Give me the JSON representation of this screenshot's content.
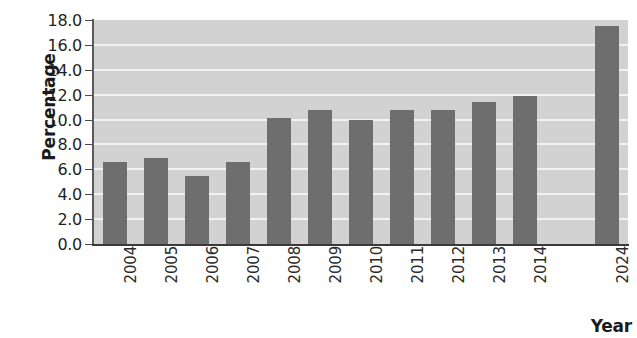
{
  "chart_data": {
    "type": "bar",
    "title": "",
    "xlabel": "Year",
    "ylabel": "Percentage",
    "categories": [
      "2004",
      "2005",
      "2006",
      "2007",
      "2008",
      "2009",
      "2010",
      "2011",
      "2012",
      "2013",
      "2014",
      "2024"
    ],
    "values": [
      6.6,
      6.9,
      5.5,
      6.6,
      10.1,
      10.8,
      10.0,
      10.8,
      10.8,
      11.4,
      11.9,
      17.5
    ],
    "ylim": [
      0.0,
      18.0
    ],
    "ytick_step": 2.0,
    "ytick_labels": [
      "0.0",
      "2.0",
      "4.0",
      "6.0",
      "8.0",
      "10.0",
      "12.0",
      "14.0",
      "16.0",
      "18.0"
    ],
    "ytick_values": [
      0.0,
      2.0,
      4.0,
      6.0,
      8.0,
      10.0,
      12.0,
      14.0,
      16.0,
      18.0
    ],
    "grid": true,
    "grid_axis": "y",
    "legend": false,
    "category_gap_before_last": true,
    "colors": {
      "bar": "#6e6e6e",
      "plot_background": "#d2d2d2",
      "gridline": "#f2f2f2",
      "axis": "#3a3a3a",
      "text": "#1b1b1b"
    }
  }
}
